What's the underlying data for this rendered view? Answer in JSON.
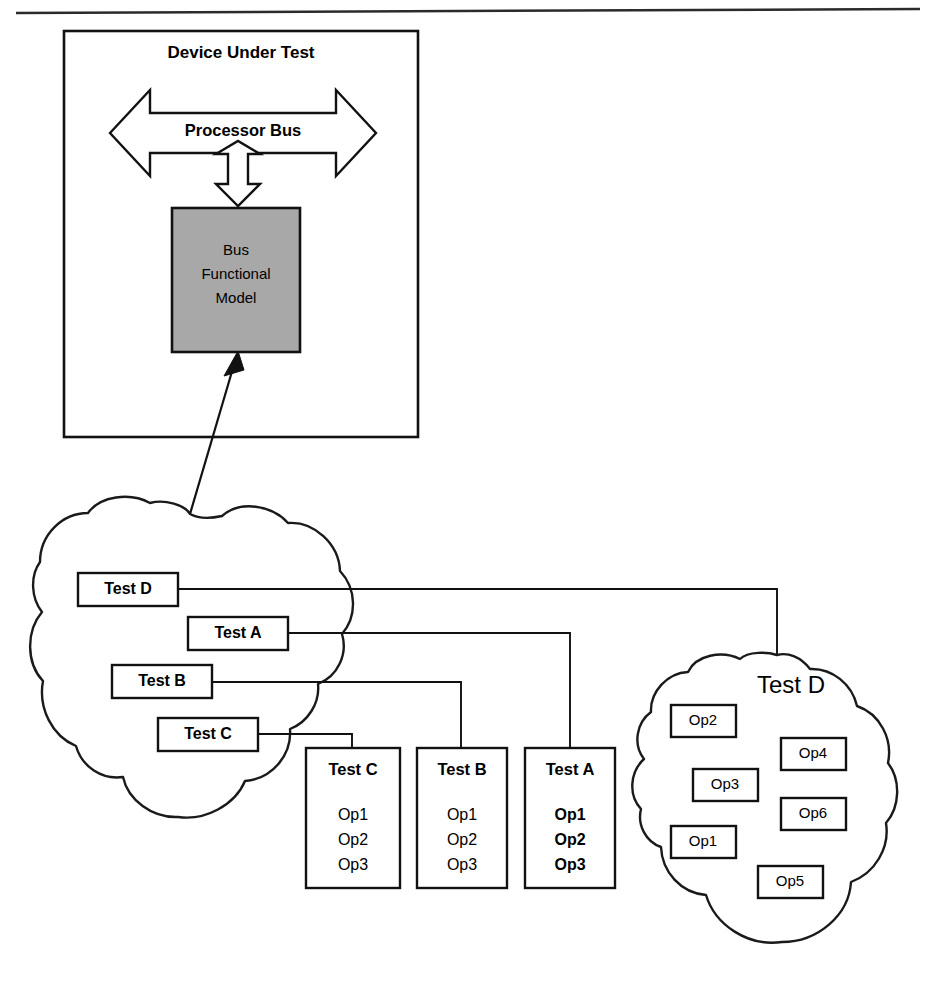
{
  "diagram": {
    "device_under_test": {
      "title": "Device Under Test",
      "bus_label": "Processor Bus",
      "bfm": {
        "line1": "Bus",
        "line2": "Functional",
        "line3": "Model"
      }
    },
    "test_cloud": {
      "labels": [
        {
          "id": "test-d",
          "text": "Test D"
        },
        {
          "id": "test-a",
          "text": "Test A"
        },
        {
          "id": "test-b",
          "text": "Test B"
        },
        {
          "id": "test-c",
          "text": "Test C"
        }
      ]
    },
    "test_detail_boxes": [
      {
        "id": "detail-test-c",
        "title": "Test C",
        "bold_ops": false,
        "ops": [
          "Op1",
          "Op2",
          "Op3"
        ]
      },
      {
        "id": "detail-test-b",
        "title": "Test B",
        "bold_ops": false,
        "ops": [
          "Op1",
          "Op2",
          "Op3"
        ]
      },
      {
        "id": "detail-test-a",
        "title": "Test  A",
        "bold_ops": true,
        "ops": [
          "Op1",
          "Op2",
          "Op3"
        ]
      }
    ],
    "test_d_cloud": {
      "title": "Test D",
      "ops": [
        {
          "id": "op2",
          "text": "Op2"
        },
        {
          "id": "op4",
          "text": "Op4"
        },
        {
          "id": "op3",
          "text": "Op3"
        },
        {
          "id": "op6",
          "text": "Op6"
        },
        {
          "id": "op1",
          "text": "Op1"
        },
        {
          "id": "op5",
          "text": "Op5"
        }
      ]
    },
    "colors": {
      "line": "#111111",
      "bfm_fill": "#a8a8a8",
      "background": "#ffffff"
    }
  }
}
